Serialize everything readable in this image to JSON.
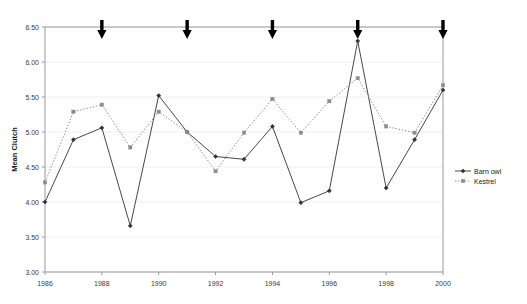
{
  "chart_data": {
    "type": "line",
    "title": "",
    "xlabel": "",
    "ylabel": "Mean Clutch",
    "x": [
      1986,
      1987,
      1988,
      1989,
      1990,
      1991,
      1992,
      1993,
      1994,
      1995,
      1996,
      1997,
      1998,
      1999,
      2000
    ],
    "xlim": [
      1986,
      2000
    ],
    "ylim": [
      3.0,
      6.5
    ],
    "y_ticks": [
      "3.00",
      "3.50",
      "4.00",
      "4.50",
      "5.00",
      "5.50",
      "6.00",
      "6.50"
    ],
    "y_tick_values": [
      3.0,
      3.5,
      4.0,
      4.5,
      5.0,
      5.5,
      6.0,
      6.5
    ],
    "x_ticks": [
      "1986",
      "1988",
      "1990",
      "1992",
      "1994",
      "1996",
      "1998",
      "2000"
    ],
    "x_tick_values": [
      1986,
      1988,
      1990,
      1992,
      1994,
      1996,
      1998,
      2000
    ],
    "grid": true,
    "legend_position": "right",
    "series": [
      {
        "name": "Barn owl",
        "line_style": "solid",
        "marker": "diamond",
        "color": "#333333",
        "values": [
          4.0,
          4.89,
          5.06,
          3.66,
          5.52,
          5.0,
          4.65,
          4.61,
          5.08,
          3.99,
          4.16,
          6.3,
          4.2,
          4.89,
          5.6
        ]
      },
      {
        "name": "Kestrel",
        "line_style": "dotted",
        "marker": "square",
        "color": "#8c8c8c",
        "values": [
          4.28,
          5.29,
          5.39,
          4.78,
          5.29,
          5.0,
          4.44,
          4.99,
          5.47,
          4.99,
          5.44,
          5.77,
          5.08,
          4.99,
          5.67
        ]
      }
    ],
    "annotations": {
      "type": "down-arrow",
      "color": "#000000",
      "x_positions": [
        1988,
        1991,
        1994,
        1997,
        2000
      ],
      "y_position": 6.5
    }
  },
  "legend": {
    "entries": [
      {
        "label": "Barn owl"
      },
      {
        "label": "Kestrel"
      }
    ]
  }
}
